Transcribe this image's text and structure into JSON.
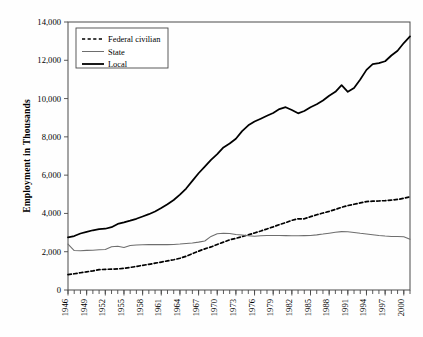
{
  "chart_data": {
    "type": "line",
    "title": "",
    "subtitle": "",
    "xlabel": "",
    "ylabel": "Employment in Thousands",
    "xlim": [
      1946,
      2001
    ],
    "ylim": [
      0,
      14000
    ],
    "ytick_labels": [
      "0",
      "2,000",
      "4,000",
      "6,000",
      "8,000",
      "10,000",
      "12,000",
      "14,000"
    ],
    "ytick_values": [
      0,
      2000,
      4000,
      6000,
      8000,
      10000,
      12000,
      14000
    ],
    "xtick_labels": [
      "1946",
      "1949",
      "1952",
      "1955",
      "1958",
      "1961",
      "1964",
      "1967",
      "1970",
      "1973",
      "1976",
      "1979",
      "1982",
      "1985",
      "1988",
      "1991",
      "1994",
      "1997",
      "2000"
    ],
    "xtick_values": [
      1946,
      1949,
      1952,
      1955,
      1958,
      1961,
      1964,
      1967,
      1970,
      1973,
      1976,
      1979,
      1982,
      1985,
      1988,
      1991,
      1994,
      1997,
      2000
    ],
    "minor_xticks_annual": true,
    "grid": false,
    "legend_position": "top-left",
    "x": [
      1946,
      1947,
      1948,
      1949,
      1950,
      1951,
      1952,
      1953,
      1954,
      1955,
      1956,
      1957,
      1958,
      1959,
      1960,
      1961,
      1962,
      1963,
      1964,
      1965,
      1966,
      1967,
      1968,
      1969,
      1970,
      1971,
      1972,
      1973,
      1974,
      1975,
      1976,
      1977,
      1978,
      1979,
      1980,
      1981,
      1982,
      1983,
      1984,
      1985,
      1986,
      1987,
      1988,
      1989,
      1990,
      1991,
      1992,
      1993,
      1994,
      1995,
      1996,
      1997,
      1998,
      1999,
      2000,
      2001
    ],
    "series": [
      {
        "name": "Federal civilian",
        "style": "dashed",
        "color": "#000000",
        "values": [
          800,
          850,
          900,
          950,
          1000,
          1060,
          1080,
          1090,
          1100,
          1130,
          1180,
          1230,
          1290,
          1340,
          1400,
          1460,
          1520,
          1580,
          1660,
          1760,
          1900,
          2030,
          2150,
          2250,
          2380,
          2500,
          2620,
          2700,
          2790,
          2880,
          2980,
          3080,
          3190,
          3300,
          3420,
          3520,
          3640,
          3720,
          3720,
          3830,
          3930,
          4020,
          4110,
          4210,
          4320,
          4410,
          4480,
          4550,
          4620,
          4640,
          4650,
          4670,
          4700,
          4730,
          4790,
          4870
        ],
        "endpoint_value": 4870,
        "start_value": 800
      },
      {
        "name": "State",
        "style": "solid-thin",
        "color": "#6e6e6e",
        "values": [
          2400,
          2060,
          2050,
          2070,
          2080,
          2100,
          2120,
          2260,
          2280,
          2220,
          2320,
          2350,
          2360,
          2370,
          2370,
          2370,
          2370,
          2380,
          2400,
          2430,
          2450,
          2500,
          2560,
          2800,
          2940,
          2960,
          2950,
          2900,
          2870,
          2830,
          2810,
          2830,
          2850,
          2850,
          2850,
          2840,
          2830,
          2830,
          2840,
          2850,
          2880,
          2920,
          2970,
          3020,
          3050,
          3040,
          3000,
          2960,
          2930,
          2890,
          2850,
          2820,
          2800,
          2790,
          2780,
          2650
        ],
        "peak_value": 3050,
        "peak_year": 1990,
        "endpoint_value": 2650
      },
      {
        "name": "Local",
        "style": "solid-thick",
        "color": "#000000",
        "values": [
          2750,
          2820,
          2950,
          3040,
          3120,
          3180,
          3200,
          3280,
          3450,
          3530,
          3620,
          3720,
          3840,
          3960,
          4100,
          4280,
          4480,
          4700,
          4980,
          5300,
          5700,
          6100,
          6450,
          6800,
          7100,
          7450,
          7650,
          7900,
          8300,
          8600,
          8800,
          8950,
          9100,
          9250,
          9450,
          9550,
          9400,
          9230,
          9350,
          9550,
          9700,
          9900,
          10150,
          10350,
          10700,
          10350,
          10550,
          11000,
          11500,
          11800,
          11850,
          11950,
          12250,
          12500,
          12900,
          13250
        ],
        "endpoint_value": 13250,
        "start_value": 2750
      }
    ]
  },
  "legend": {
    "items": [
      {
        "label": "Federal civilian",
        "style": "dashed"
      },
      {
        "label": "State",
        "style": "solid-thin"
      },
      {
        "label": "Local",
        "style": "solid-thick"
      }
    ]
  },
  "colors": {
    "background": "#fefefe",
    "axis": "#4a4a4a",
    "federal": "#000000",
    "state": "#6e6e6e",
    "local": "#000000"
  }
}
